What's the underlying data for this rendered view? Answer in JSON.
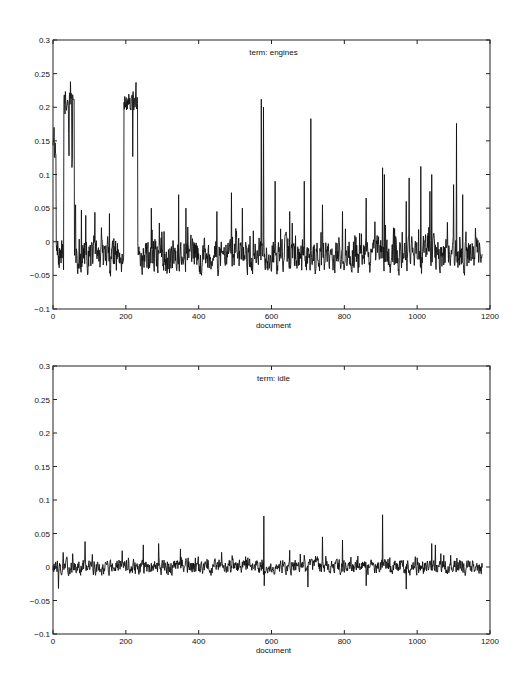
{
  "chart_data": [
    {
      "type": "line",
      "title": "term: engines",
      "xlabel": "document",
      "ylabel": "",
      "xlim": [
        0,
        1200
      ],
      "ylim": [
        -0.1,
        0.3
      ],
      "xticks": [
        0,
        200,
        400,
        600,
        800,
        1000,
        1200
      ],
      "xtick_labels": [
        "0",
        "200",
        "400",
        "600",
        "800",
        "1000",
        "1200"
      ],
      "yticks": [
        -0.1,
        -0.05,
        0,
        0.05,
        0.1,
        0.15,
        0.2,
        0.25,
        0.3
      ],
      "ytick_labels": [
        "-0.1",
        "-0.05",
        "0",
        "0.05",
        "0.1",
        "0.15",
        "0.2",
        "0.25",
        "0.3"
      ],
      "grid": false,
      "n_points": 1180,
      "baseline": -0.02,
      "noise_amplitude": 0.022,
      "seed": 7,
      "plateaus": [
        {
          "x_start": 0,
          "x_end": 8,
          "level": 0.14
        },
        {
          "x_start": 30,
          "x_end": 58,
          "level": 0.21
        },
        {
          "x_start": 195,
          "x_end": 232,
          "level": 0.21
        }
      ],
      "peaks": [
        {
          "x": 3,
          "y": 0.17
        },
        {
          "x": 48,
          "y": 0.238
        },
        {
          "x": 228,
          "y": 0.237
        },
        {
          "x": 62,
          "y": 0.055
        },
        {
          "x": 78,
          "y": 0.047
        },
        {
          "x": 155,
          "y": 0.042
        },
        {
          "x": 270,
          "y": 0.05
        },
        {
          "x": 345,
          "y": 0.07
        },
        {
          "x": 365,
          "y": 0.05
        },
        {
          "x": 450,
          "y": 0.045
        },
        {
          "x": 490,
          "y": 0.073
        },
        {
          "x": 520,
          "y": 0.05
        },
        {
          "x": 572,
          "y": 0.212
        },
        {
          "x": 578,
          "y": 0.2
        },
        {
          "x": 610,
          "y": 0.09
        },
        {
          "x": 650,
          "y": 0.045
        },
        {
          "x": 690,
          "y": 0.09
        },
        {
          "x": 708,
          "y": 0.183
        },
        {
          "x": 740,
          "y": 0.055
        },
        {
          "x": 795,
          "y": 0.045
        },
        {
          "x": 860,
          "y": 0.065
        },
        {
          "x": 905,
          "y": 0.11
        },
        {
          "x": 910,
          "y": 0.1
        },
        {
          "x": 970,
          "y": 0.06
        },
        {
          "x": 978,
          "y": 0.095
        },
        {
          "x": 1010,
          "y": 0.112
        },
        {
          "x": 1035,
          "y": 0.075
        },
        {
          "x": 1040,
          "y": 0.1
        },
        {
          "x": 1100,
          "y": 0.085
        },
        {
          "x": 1108,
          "y": 0.176
        },
        {
          "x": 1125,
          "y": 0.07
        },
        {
          "x": 1160,
          "y": 0.02
        }
      ],
      "color": "#111111"
    },
    {
      "type": "line",
      "title": "term: idle",
      "xlabel": "document",
      "ylabel": "",
      "xlim": [
        0,
        1200
      ],
      "ylim": [
        -0.1,
        0.3
      ],
      "xticks": [
        0,
        200,
        400,
        600,
        800,
        1000,
        1200
      ],
      "xtick_labels": [
        "0",
        "200",
        "400",
        "600",
        "800",
        "1000",
        "1200"
      ],
      "yticks": [
        -0.1,
        -0.05,
        0,
        0.05,
        0.1,
        0.15,
        0.2,
        0.25,
        0.3
      ],
      "ytick_labels": [
        "-0.1",
        "-0.05",
        "0",
        "0.05",
        "0.1",
        "0.15",
        "0.2",
        "0.25",
        "0.3"
      ],
      "grid": false,
      "n_points": 1180,
      "baseline": 0.0,
      "noise_amplitude": 0.009,
      "seed": 13,
      "plateaus": [],
      "peaks": [
        {
          "x": 15,
          "y": -0.032
        },
        {
          "x": 88,
          "y": 0.038
        },
        {
          "x": 248,
          "y": 0.033
        },
        {
          "x": 290,
          "y": 0.035
        },
        {
          "x": 350,
          "y": 0.027
        },
        {
          "x": 579,
          "y": 0.076
        },
        {
          "x": 580,
          "y": -0.028
        },
        {
          "x": 650,
          "y": 0.025
        },
        {
          "x": 700,
          "y": -0.03
        },
        {
          "x": 740,
          "y": 0.045
        },
        {
          "x": 795,
          "y": 0.04
        },
        {
          "x": 860,
          "y": -0.028
        },
        {
          "x": 905,
          "y": 0.078
        },
        {
          "x": 970,
          "y": -0.033
        },
        {
          "x": 1040,
          "y": 0.035
        },
        {
          "x": 1050,
          "y": 0.033
        }
      ],
      "color": "#111111"
    }
  ],
  "plots": [
    {
      "title": "term: engines",
      "xlabel": "document"
    },
    {
      "title": "term: idle",
      "xlabel": "document"
    }
  ]
}
